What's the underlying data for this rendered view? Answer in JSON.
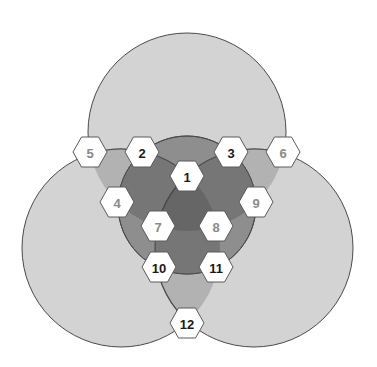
{
  "diagram": {
    "type": "venn-hexagon-map",
    "colors": {
      "background": "#ffffff",
      "outer_circle": "#d3d3d3",
      "pair_overlap": "#b2b2b2",
      "inner_circle": "#8e8e8e",
      "inner_pair": "#767676",
      "inner_triple": "#666666",
      "stroke": "#4a4a4a",
      "hex_fill": "#ffffff",
      "label_dark": "#1a1a1a",
      "label_light": "#8a8a8a"
    },
    "outer_circles": [
      {
        "name": "top",
        "cx": 187,
        "cy": 132,
        "r": 99
      },
      {
        "name": "left",
        "cx": 121,
        "cy": 248,
        "r": 99
      },
      {
        "name": "right",
        "cx": 254,
        "cy": 248,
        "r": 99
      }
    ],
    "inner_circle": {
      "cx": 187,
      "cy": 205,
      "r": 69
    },
    "hexagons": [
      {
        "id": "1",
        "label": "1",
        "x": 187,
        "y": 176,
        "tone": "dark"
      },
      {
        "id": "2",
        "label": "2",
        "x": 142,
        "y": 152,
        "tone": "dark"
      },
      {
        "id": "3",
        "label": "3",
        "x": 231,
        "y": 152,
        "tone": "dark"
      },
      {
        "id": "4",
        "label": "4",
        "x": 117,
        "y": 202,
        "tone": "light"
      },
      {
        "id": "5",
        "label": "5",
        "x": 90,
        "y": 152,
        "tone": "light"
      },
      {
        "id": "6",
        "label": "6",
        "x": 283,
        "y": 152,
        "tone": "light"
      },
      {
        "id": "7",
        "label": "7",
        "x": 158,
        "y": 226,
        "tone": "light"
      },
      {
        "id": "8",
        "label": "8",
        "x": 216,
        "y": 226,
        "tone": "light"
      },
      {
        "id": "9",
        "label": "9",
        "x": 256,
        "y": 202,
        "tone": "light"
      },
      {
        "id": "10",
        "label": "10",
        "x": 159,
        "y": 267,
        "tone": "dark"
      },
      {
        "id": "11",
        "label": "11",
        "x": 216,
        "y": 267,
        "tone": "dark"
      },
      {
        "id": "12",
        "label": "12",
        "x": 187,
        "y": 323,
        "tone": "dark"
      }
    ]
  }
}
